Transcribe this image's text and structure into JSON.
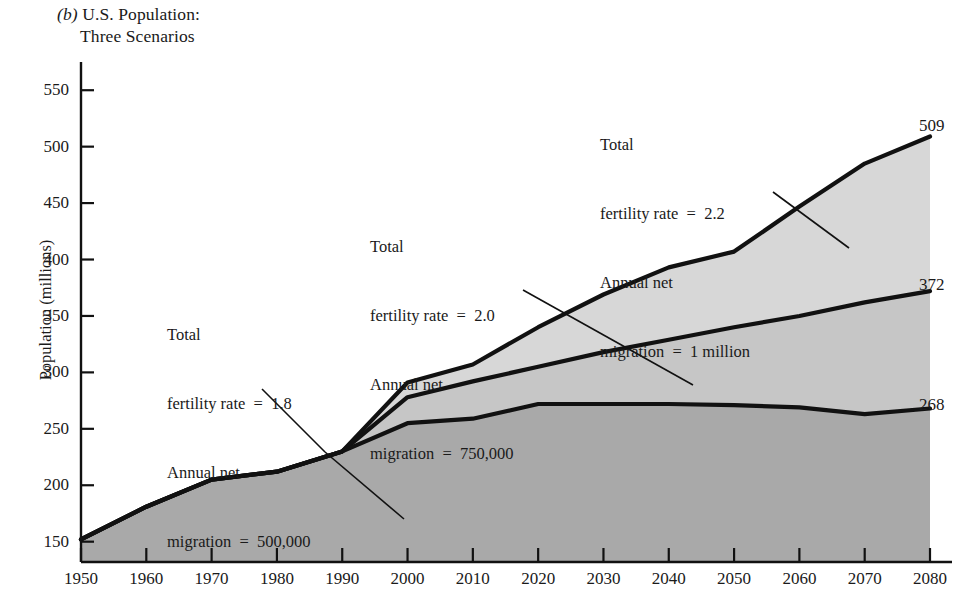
{
  "figure": {
    "panel_letter": "(b)",
    "title_line1": "U.S. Population:",
    "title_line2": "Three Scenarios"
  },
  "axes": {
    "ylabel": "Population (millions)",
    "yticks": [
      150,
      200,
      250,
      300,
      350,
      400,
      450,
      500,
      550
    ],
    "ylim": [
      132,
      575
    ],
    "xticks": [
      1950,
      1960,
      1970,
      1980,
      1990,
      2000,
      2010,
      2020,
      2030,
      2040,
      2050,
      2060,
      2070,
      2080
    ],
    "xlim": [
      1950,
      2080
    ],
    "grid": false
  },
  "annotations": [
    {
      "id": "low",
      "line1": "Total",
      "line2": "fertility rate  =  1.8",
      "line3": "Annual net",
      "line4": "migration  =  500,000"
    },
    {
      "id": "medium",
      "line1": "Total",
      "line2": "fertility rate  =  2.0",
      "line3": "Annual net",
      "line4": "migration  =  750,000"
    },
    {
      "id": "high",
      "line1": "Total",
      "line2": "fertility rate  =  2.2",
      "line3": "Annual net",
      "line4": "migration  =  1 million"
    }
  ],
  "end_labels": {
    "high": "509",
    "medium": "372",
    "low": "268"
  },
  "colors": {
    "band_low": "#a9a9a9",
    "band_medium": "#c6c6c6",
    "band_high": "#d7d7d7",
    "line": "#111111",
    "background": "#ffffff"
  },
  "chart_data": {
    "type": "area",
    "xlabel": "",
    "ylabel": "Population (millions)",
    "xlim": [
      1950,
      2080
    ],
    "ylim": [
      132,
      575
    ],
    "grid": false,
    "legend": "inline annotations",
    "x": [
      1950,
      1960,
      1970,
      1980,
      1990,
      2000,
      2010,
      2020,
      2030,
      2040,
      2050,
      2060,
      2070,
      2080
    ],
    "series": [
      {
        "name": "Total fertility rate = 1.8, Annual net migration = 500,000",
        "shade": "#a9a9a9",
        "end_value": 268,
        "values": [
          152,
          181,
          205,
          212,
          230,
          255,
          259,
          272,
          272,
          272,
          271,
          269,
          263,
          268
        ]
      },
      {
        "name": "Total fertility rate = 2.0, Annual net migration = 750,000",
        "shade": "#c6c6c6",
        "end_value": 372,
        "values": [
          152,
          181,
          205,
          212,
          230,
          278,
          292,
          305,
          318,
          329,
          340,
          350,
          362,
          372
        ]
      },
      {
        "name": "Total fertility rate = 2.2, Annual net migration = 1 million",
        "shade": "#d7d7d7",
        "end_value": 509,
        "values": [
          152,
          181,
          205,
          212,
          230,
          291,
          307,
          340,
          369,
          393,
          407,
          447,
          485,
          509
        ]
      }
    ]
  }
}
